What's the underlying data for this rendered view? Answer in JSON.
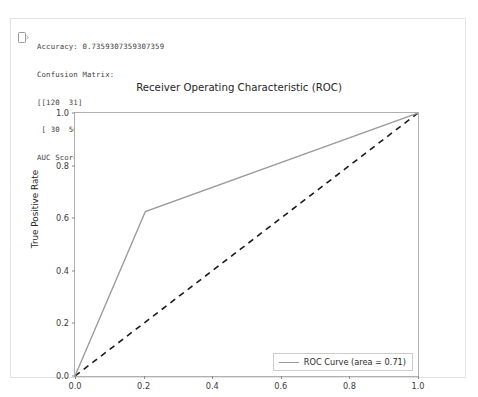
{
  "cell": {
    "marker_icon": "output-prompt-icon",
    "stdout_lines": [
      "Accuracy: 0.7359307359307359",
      "Confusion Matrix:",
      "[[120  31]",
      " [ 30  50]]",
      "AUC Score: 0.7098509933774835"
    ],
    "metrics": {
      "accuracy_label": "Accuracy:",
      "accuracy_value": "0.7359307359307359",
      "confusion_matrix_label": "Confusion Matrix:",
      "confusion_matrix": [
        [
          120,
          31
        ],
        [
          30,
          50
        ]
      ],
      "auc_label": "AUC Score:",
      "auc_value": "0.7098509933774835"
    }
  },
  "chart_data": {
    "type": "line",
    "title": "Receiver Operating Characteristic (ROC)",
    "xlabel": "False Positive Rate",
    "ylabel": "True Positive Rate",
    "xlim": [
      0.0,
      1.0
    ],
    "ylim": [
      0.0,
      1.0
    ],
    "grid": false,
    "legend_position": "lower right",
    "xticks": [
      "0.0",
      "0.2",
      "0.4",
      "0.6",
      "0.8",
      "1.0"
    ],
    "xtick_values": [
      0.0,
      0.2,
      0.4,
      0.6,
      0.8,
      1.0
    ],
    "yticks": [
      "0.0",
      "0.2",
      "0.4",
      "0.6",
      "0.8",
      "1.0"
    ],
    "ytick_values": [
      0.0,
      0.2,
      0.4,
      0.6,
      0.8,
      1.0
    ],
    "series": [
      {
        "name": "ROC Curve (area = 0.71)",
        "legend_label": "ROC Curve (area = 0.71)",
        "auc_area": 0.71,
        "style": "solid",
        "color": "#9a9a9a",
        "x": [
          0.0,
          0.205,
          1.0
        ],
        "y": [
          0.0,
          0.625,
          1.0
        ]
      },
      {
        "name": "chance-diagonal",
        "legend_label": "",
        "style": "dashed",
        "color": "#1a1a1a",
        "x": [
          0.0,
          1.0
        ],
        "y": [
          0.0,
          1.0
        ]
      }
    ]
  },
  "colors": {
    "roc_curve": "#9a9a9a",
    "diagonal": "#1a1a1a",
    "axis": "#b0b0b0",
    "text": "#262626",
    "cell_border": "#e3e3e3"
  }
}
